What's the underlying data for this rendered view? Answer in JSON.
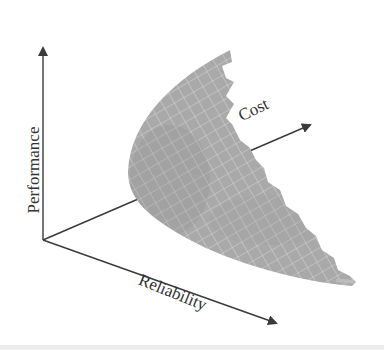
{
  "diagram": {
    "type": "3d-tradeoff-surface",
    "axes": [
      {
        "id": "performance",
        "label": "Performance",
        "direction": "vertical-up"
      },
      {
        "id": "cost",
        "label": "Cost",
        "direction": "depth-up-right"
      },
      {
        "id": "reliability",
        "label": "Reliability",
        "direction": "diagonal-down-right"
      }
    ],
    "surface": {
      "description": "Curved gray meshed surface (trade-off / Pareto front) between the three axes",
      "fill_color": "#a9a9a9",
      "grid_color": "#d6d6d6"
    },
    "colors": {
      "axis": "#3a3a3a",
      "text": "#333333",
      "background": "#ffffff"
    }
  }
}
